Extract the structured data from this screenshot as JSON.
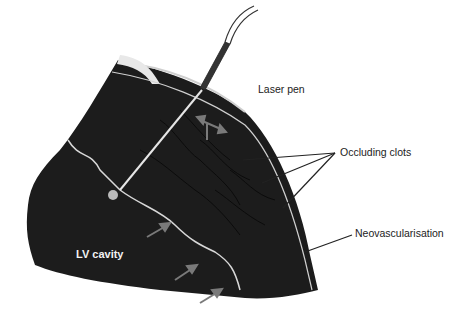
{
  "diagram": {
    "labels": {
      "laser_pen": "Laser pen",
      "occluding_clots": "Occluding clots",
      "neovascularisation": "Neovascularisation",
      "lv_cavity": "LV cavity"
    },
    "colors": {
      "tissue": "#1c1c1c",
      "background": "#ffffff",
      "arrow": "#7a7a7a",
      "endocardium_line": "#d8d8d8",
      "leader_line": "#222222"
    }
  }
}
